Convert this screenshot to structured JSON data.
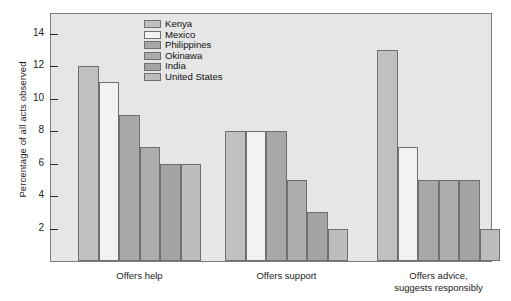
{
  "chart_data": {
    "type": "bar",
    "title": "",
    "subtitle": "",
    "xlabel": "",
    "ylabel": "Percentage of all acts observed",
    "ylim": [
      0,
      15.2
    ],
    "yticks": [
      2,
      4,
      6,
      8,
      10,
      12,
      14
    ],
    "ytick_labels": [
      "2",
      "4",
      "6",
      "8",
      "10",
      "12",
      "14"
    ],
    "grid": false,
    "legend_position": "top-center-left",
    "categories": [
      "Offers help",
      "Offers support",
      "Offers advice, suggests responsibly"
    ],
    "category_lines": [
      [
        "Offers help"
      ],
      [
        "Offers support"
      ],
      [
        "Offers advice,",
        "suggests responsibly"
      ]
    ],
    "series": [
      {
        "name": "Kenya",
        "color": "#c0c0c0",
        "values": [
          12,
          8,
          13
        ]
      },
      {
        "name": "Mexico",
        "color": "#f2f2f2",
        "values": [
          11,
          8,
          7
        ]
      },
      {
        "name": "Philippines",
        "color": "#a8a8a8",
        "values": [
          9,
          8,
          5
        ]
      },
      {
        "name": "Okinawa",
        "color": "#adadad",
        "values": [
          7,
          5,
          5
        ]
      },
      {
        "name": "India",
        "color": "#a3a3a3",
        "values": [
          6,
          3,
          5
        ]
      },
      {
        "name": "United States",
        "color": "#bdbdbd",
        "values": [
          6,
          2,
          2
        ]
      }
    ]
  },
  "legend": {
    "items": [
      {
        "label": "Kenya"
      },
      {
        "label": "Mexico"
      },
      {
        "label": "Philippines"
      },
      {
        "label": "Okinawa"
      },
      {
        "label": "India"
      },
      {
        "label": "United States"
      }
    ]
  },
  "axes": {
    "y_title": "Percentage of all acts observed"
  },
  "colors": {
    "plot_background": "#e6e6e6",
    "page_background": "#ffffff",
    "frame": "#7d7d7d",
    "bar_outline": "#6f6f6f",
    "text": "#1b1b1b"
  }
}
